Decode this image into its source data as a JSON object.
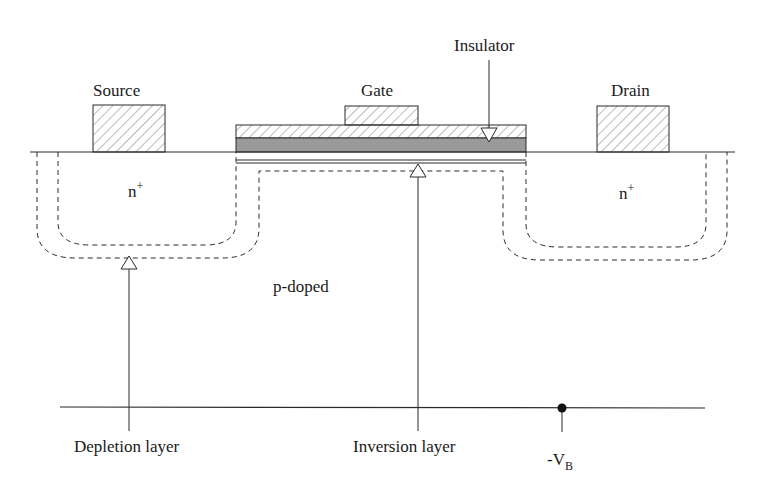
{
  "diagram": {
    "type": "mosfet-cross-section",
    "labels": {
      "source": "Source",
      "gate": "Gate",
      "drain": "Drain",
      "insulator": "Insulator",
      "n_plus_left_base": "n",
      "n_plus_left_sup": "+",
      "n_plus_right_base": "n",
      "n_plus_right_sup": "+",
      "substrate": "p-doped",
      "depletion": "Depletion layer",
      "inversion": "Inversion layer",
      "vb_prefix": "-V",
      "vb_sub": "B"
    },
    "colors": {
      "line": "#2a2a2a",
      "insulator_fill": "#9a9a9a",
      "hatch": "#6a6a6a",
      "background": "#ffffff"
    }
  }
}
